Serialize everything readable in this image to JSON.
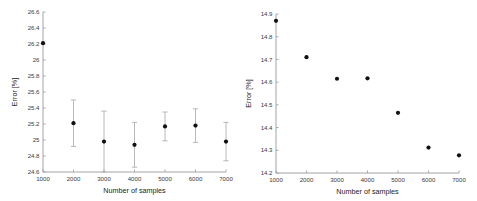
{
  "figure": {
    "background_color": "#ffffff",
    "axis_color": "#9a9a9a",
    "marker_color": "#111111",
    "errorbar_color": "#b0b0b0",
    "text_color": "#3a3a3a",
    "panel_count": 2
  },
  "chart_data": [
    {
      "panel": "left",
      "type": "scatter",
      "title": "",
      "xlabel": "Number of samples",
      "ylabel": "Error [%]",
      "xlim": [
        1000,
        7000
      ],
      "ylim": [
        24.6,
        26.6
      ],
      "grid": false,
      "legend": null,
      "xticks": [
        1000,
        2000,
        3000,
        4000,
        5000,
        6000,
        7000
      ],
      "xticklabels": [
        "1000",
        "2000",
        "3000",
        "4000",
        "5000",
        "6000",
        "7000"
      ],
      "yticks": [
        24.6,
        24.8,
        25,
        25.2,
        25.4,
        25.6,
        25.8,
        26,
        26.2,
        26.4,
        26.6
      ],
      "yticklabels": [
        "24.6",
        "24.8",
        "25",
        "25.2",
        "25.4",
        "25.6",
        "25.8",
        "26",
        "26.2",
        "26.4",
        "26.6"
      ],
      "has_errorbars": true,
      "x": [
        1000,
        2000,
        3000,
        4000,
        5000,
        6000,
        7000
      ],
      "values": [
        26.21,
        25.21,
        24.98,
        24.94,
        25.17,
        25.18,
        24.98
      ],
      "yerr": [
        0.0,
        0.29,
        0.38,
        0.28,
        0.18,
        0.21,
        0.24
      ],
      "points": [
        {
          "x": 1000,
          "y": 26.21,
          "err": 0.0
        },
        {
          "x": 2000,
          "y": 25.21,
          "err": 0.29
        },
        {
          "x": 3000,
          "y": 24.98,
          "err": 0.38
        },
        {
          "x": 4000,
          "y": 24.94,
          "err": 0.28
        },
        {
          "x": 5000,
          "y": 25.17,
          "err": 0.18
        },
        {
          "x": 6000,
          "y": 25.18,
          "err": 0.21
        },
        {
          "x": 7000,
          "y": 24.98,
          "err": 0.24
        }
      ]
    },
    {
      "panel": "right",
      "type": "scatter",
      "title": "",
      "xlabel": "Number of samples",
      "ylabel": "Error [%]",
      "xlim": [
        1000,
        7000
      ],
      "ylim": [
        14.2,
        14.9
      ],
      "grid": false,
      "legend": null,
      "xticks": [
        1000,
        2000,
        3000,
        4000,
        5000,
        6000,
        7000
      ],
      "xticklabels": [
        "1000",
        "2000",
        "3000",
        "4000",
        "5000",
        "6000",
        "7000"
      ],
      "yticks": [
        14.2,
        14.3,
        14.4,
        14.5,
        14.6,
        14.7,
        14.8,
        14.9
      ],
      "yticklabels": [
        "14.2",
        "14.3",
        "14.4",
        "14.5",
        "14.6",
        "14.7",
        "14.8",
        "14.9"
      ],
      "has_errorbars": false,
      "x": [
        1000,
        2000,
        3000,
        4000,
        5000,
        6000,
        7000
      ],
      "values": [
        14.87,
        14.71,
        14.615,
        14.617,
        14.465,
        14.312,
        14.278
      ],
      "yerr": [
        0,
        0,
        0,
        0,
        0,
        0,
        0
      ],
      "points": [
        {
          "x": 1000,
          "y": 14.87,
          "err": 0
        },
        {
          "x": 2000,
          "y": 14.71,
          "err": 0
        },
        {
          "x": 3000,
          "y": 14.615,
          "err": 0
        },
        {
          "x": 4000,
          "y": 14.617,
          "err": 0
        },
        {
          "x": 5000,
          "y": 14.465,
          "err": 0
        },
        {
          "x": 6000,
          "y": 14.312,
          "err": 0
        },
        {
          "x": 7000,
          "y": 14.278,
          "err": 0
        }
      ]
    }
  ]
}
